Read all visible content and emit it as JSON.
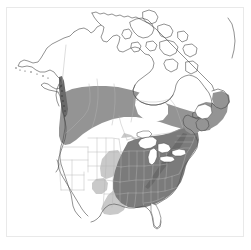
{
  "figure": {
    "kind": "range-map",
    "region": "North America",
    "title": "",
    "caption": "",
    "background_color": "#ffffff",
    "frame_color": "#e9e9e9"
  },
  "legend": {
    "visible": false,
    "classes": [
      {
        "name": "core-range",
        "label": "",
        "color": "#7b7b7b"
      },
      {
        "name": "main-range",
        "label": "",
        "color": "#949494"
      },
      {
        "name": "marginal-range",
        "label": "",
        "color": "#c9c9c9"
      },
      {
        "name": "absent",
        "label": "",
        "color": "#ffffff"
      }
    ]
  },
  "map_style": {
    "coastline_color": "#4a4a4a",
    "coastline_width": 0.6,
    "internal_border_color": "#b4b4b4",
    "internal_border_width": 0.45,
    "lake_color": "#ffffff",
    "shade_dark": "#7b7b7b",
    "shade_medium": "#949494",
    "shade_light": "#c9c9c9",
    "land_unshaded": "#ffffff"
  },
  "map_data": {
    "shaded_areas": [
      {
        "name": "pacific-northwest-coastal-strip",
        "class": "core-range"
      },
      {
        "name": "boreal-diagonal-band",
        "class": "main-range"
      },
      {
        "name": "great-lakes-and-eastern-us",
        "class": "core-range"
      },
      {
        "name": "atlantic-maritimes-newfoundland",
        "class": "main-range"
      },
      {
        "name": "great-plains-transition",
        "class": "marginal-range"
      },
      {
        "name": "texas-western-transition",
        "class": "marginal-range"
      }
    ],
    "unshaded_areas": [
      {
        "name": "arctic-archipelago"
      },
      {
        "name": "western-interior-us"
      },
      {
        "name": "florida-peninsula"
      },
      {
        "name": "hudson-bay"
      },
      {
        "name": "great-lakes"
      },
      {
        "name": "gulf-of-st-lawrence"
      }
    ]
  }
}
